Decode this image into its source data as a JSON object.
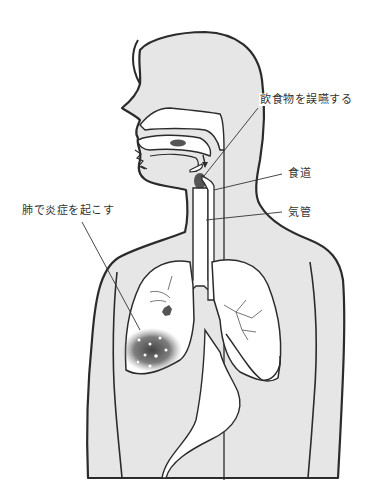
{
  "diagram": {
    "colors": {
      "body_fill": "#e6e6e6",
      "outline": "#2b2b2b",
      "organ_fill": "#ffffff",
      "inflammation": "#555555",
      "bolus": "#555555"
    },
    "labels": [
      {
        "id": "aspiration",
        "text": "飲食物を誤嚥する"
      },
      {
        "id": "esophagus",
        "text": "食道"
      },
      {
        "id": "trachea",
        "text": "気管"
      },
      {
        "id": "pneumonia",
        "text": "肺で炎症を起こす"
      }
    ]
  }
}
